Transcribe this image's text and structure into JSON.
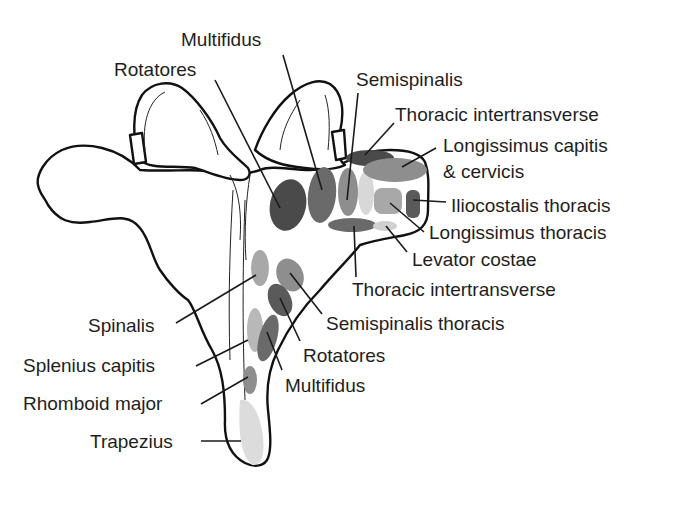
{
  "figure": {
    "colors": {
      "background": "#ffffff",
      "outline": "#111111",
      "label_text": "#1e1e1e",
      "shade_dark": "#4a4a4a",
      "shade_medium_dark": "#6a6a6a",
      "shade_medium": "#8e8e8e",
      "shade_light": "#b0b0b0",
      "shade_lightest": "#d8d8d8"
    }
  },
  "labels": {
    "multifidus_top": "Multifidus",
    "rotatores_top": "Rotatores",
    "semispinalis": "Semispinalis",
    "thoracic_intertransverse_top": "Thoracic intertransverse",
    "longissimus_capitis_cervicis": "Longissimus capitis\n& cervicis",
    "iliocostalis_thoracis": "Iliocostalis thoracis",
    "longissimus_thoracis": "Longissimus thoracis",
    "levator_costae": "Levator costae",
    "thoracic_intertransverse_bottom": "Thoracic intertransverse",
    "semispinalis_thoracis": "Semispinalis thoracis",
    "rotatores_bottom": "Rotatores",
    "multifidus_bottom": "Multifidus",
    "spinalis": "Spinalis",
    "splenius_capitis": "Splenius capitis",
    "rhomboid_major": "Rhomboid major",
    "trapezius": "Trapezius"
  }
}
